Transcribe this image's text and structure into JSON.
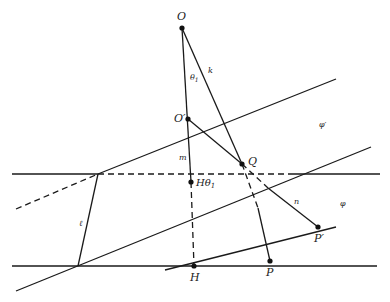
{
  "diagram": {
    "type": "geometric-projection",
    "points": {
      "O": "O",
      "O_prime": "O′",
      "Q": "Q",
      "H_theta": "Hθ",
      "H_theta_sub": "1",
      "H": "H",
      "P": "P",
      "P_prime": "P′"
    },
    "line_labels": {
      "theta1": "θ",
      "theta1_sub": "1",
      "k": "k",
      "m": "m",
      "n": "n",
      "l": "ℓ"
    },
    "plane_labels": {
      "phi_prime": "φ′",
      "phi": "φ"
    }
  }
}
